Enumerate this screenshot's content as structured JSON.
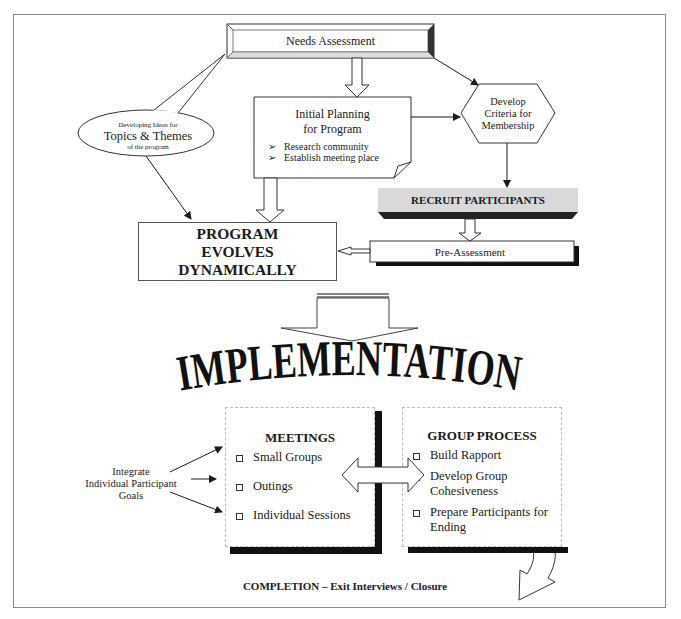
{
  "diagram": {
    "needs_assessment": {
      "label": "Needs Assessment"
    },
    "initial_planning": {
      "title_line1": "Initial Planning",
      "title_line2": "for Program",
      "bullets": [
        "Research community",
        "Establish meeting place"
      ],
      "bullet_glyph": "➢"
    },
    "develop_criteria": {
      "line1": "Develop",
      "line2": "Criteria for",
      "line3": "Membership"
    },
    "topics_themes": {
      "line1": "Developing Ideas for",
      "line2": "Topics & Themes",
      "line3": "of the program"
    },
    "recruit_participants": {
      "label": "RECRUIT PARTICIPANTS"
    },
    "pre_assessment": {
      "label": "Pre-Assessment"
    },
    "program_evolves": {
      "line1": "PROGRAM",
      "line2": "EVOLVES",
      "line3": "DYNAMICALLY"
    },
    "implementation": {
      "label": "IMPLEMENTATION"
    },
    "meetings": {
      "title": "MEETINGS",
      "items": [
        "Small Groups",
        "Outings",
        "Individual Sessions"
      ]
    },
    "group_process": {
      "title": "GROUP PROCESS",
      "items": [
        "Build Rapport",
        "Develop Group Cohesiveness",
        "Prepare Participants for Ending"
      ]
    },
    "integrate_goals": {
      "line1": "Integrate",
      "line2": "Individual Participant",
      "line3": "Goals"
    },
    "completion": {
      "label": "COMPLETION – Exit Interviews / Closure"
    }
  },
  "colors": {
    "line": "#1a1a1a",
    "frame": "#8a8a8a",
    "shadow": "#111111",
    "recruit_fill": "#d9d9d9"
  }
}
